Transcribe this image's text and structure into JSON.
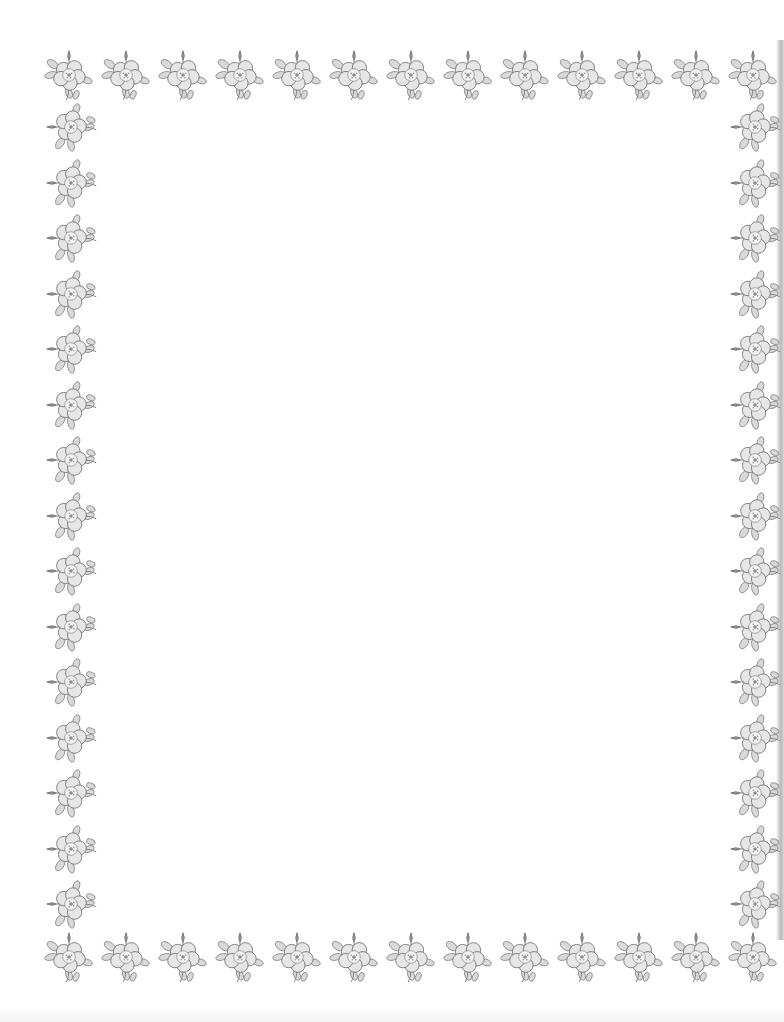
{
  "page": {
    "background": "#ffffff",
    "ink_color": "#6e6e6e",
    "leaf_color": "#8a8a8a",
    "content_text": ""
  },
  "border": {
    "motif": "rose-icon",
    "top_row": {
      "count": 13,
      "start_x": 42,
      "y": 48,
      "step": 57,
      "rotate": 0
    },
    "bottom_row": {
      "count": 13,
      "start_x": 42,
      "y": 930,
      "step": 57,
      "rotate": 0
    },
    "left_column": {
      "count": 15,
      "x": 44,
      "start_y": 100,
      "step": 55.5,
      "rotate": -90
    },
    "right_column": {
      "count": 15,
      "x": 728,
      "start_y": 100,
      "step": 55.5,
      "rotate": -90
    }
  }
}
